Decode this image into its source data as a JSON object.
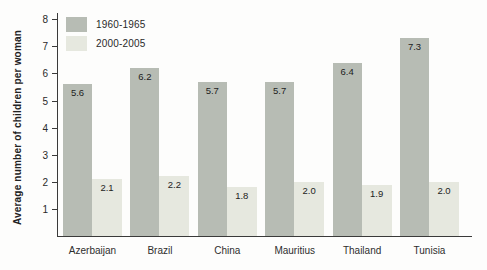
{
  "chart_data": {
    "type": "bar",
    "title": "",
    "categories": [
      "Azerbaijan",
      "Brazil",
      "China",
      "Mauritius",
      "Thailand",
      "Tunisia"
    ],
    "series": [
      {
        "name": "1960-1965",
        "values": [
          5.6,
          6.2,
          5.7,
          5.7,
          6.4,
          7.3
        ],
        "color": "#b7bcb4"
      },
      {
        "name": "2000-2005",
        "values": [
          2.1,
          2.2,
          1.8,
          2.0,
          1.9,
          2.0
        ],
        "color": "#e6e8df"
      }
    ],
    "xlabel": "",
    "ylabel": "Average number of children per woman",
    "ylim": [
      0,
      8
    ],
    "yticks": [
      1,
      2,
      3,
      4,
      5,
      6,
      7,
      8
    ],
    "grid": false,
    "legend_position": "top-left",
    "value_labels": true,
    "axis_color": "#3a3a3a",
    "text_color": "#2a2a2a"
  }
}
